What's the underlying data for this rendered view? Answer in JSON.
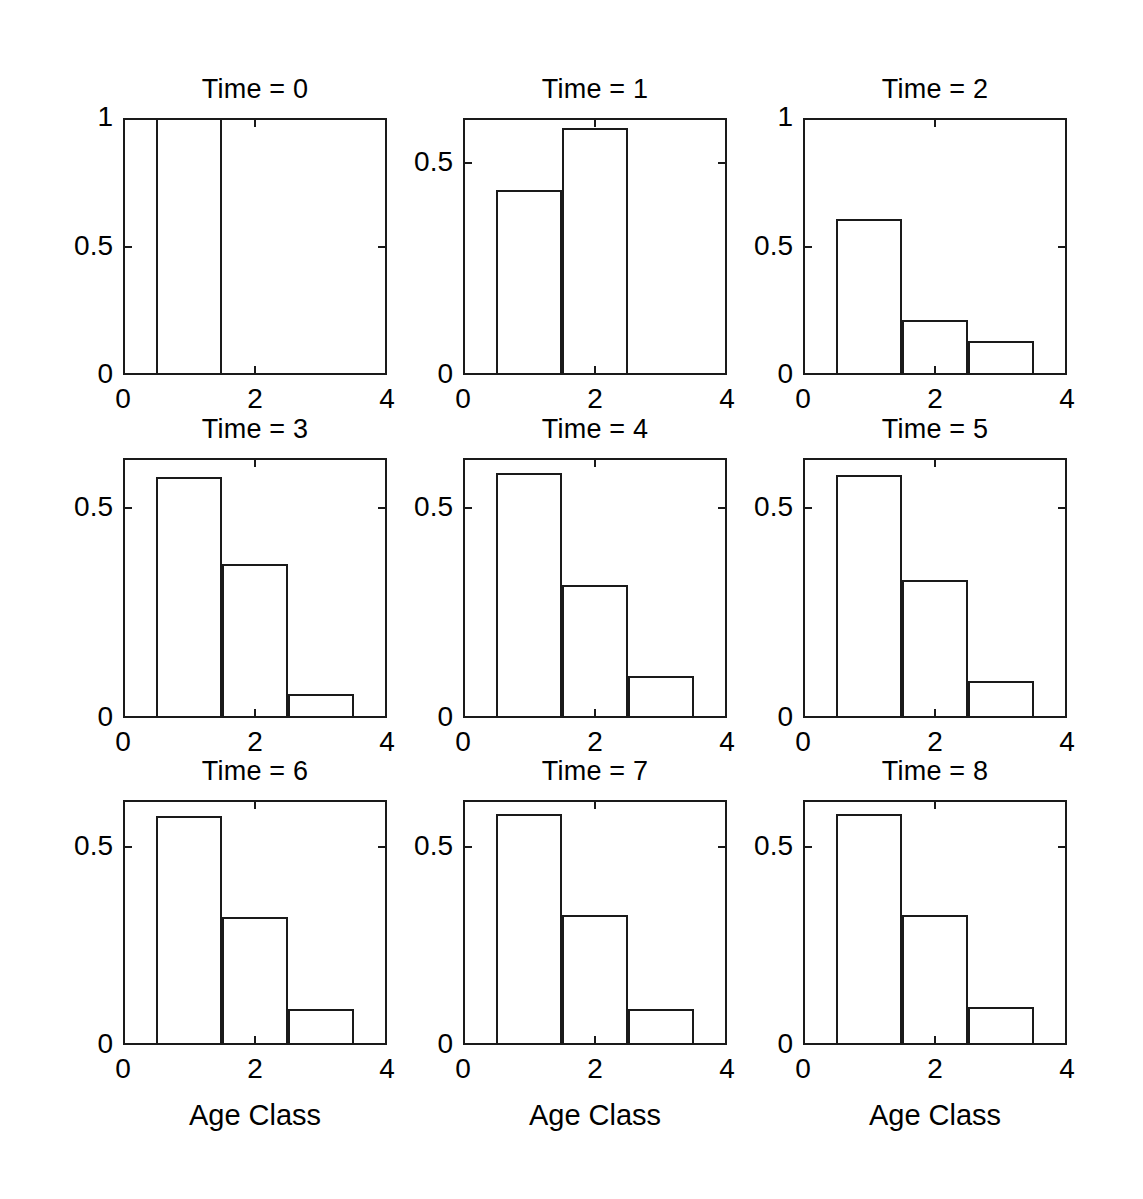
{
  "chart_data": {
    "type": "bar",
    "title": "",
    "subtitle": "",
    "layout": {
      "rows": 3,
      "cols": 3,
      "shared_xlabel": "Age Class",
      "shared_ylabel": "Fraction",
      "grid": false,
      "legend": "none"
    },
    "xlabel": "Age Class",
    "ylabel": "Fraction",
    "xlim": [
      0,
      4
    ],
    "xticks": [
      0,
      2,
      4
    ],
    "xtick_labels": [
      "0",
      "2",
      "4"
    ],
    "categories": [
      1,
      2,
      3
    ],
    "bar_width": 1.0,
    "panels": [
      {
        "id": "time-0",
        "title": "Time = 0",
        "ylim": [
          0,
          1
        ],
        "yticks": [
          0,
          0.5,
          1
        ],
        "ytick_labels": [
          "0",
          "0.5",
          "1"
        ],
        "show_ylabel": true,
        "show_xlabel": false,
        "values": [
          1.0,
          0.0,
          0.0
        ]
      },
      {
        "id": "time-1",
        "title": "Time = 1",
        "ylim": [
          0,
          0.607
        ],
        "yticks": [
          0,
          0.5
        ],
        "ytick_labels": [
          "0",
          "0.5"
        ],
        "show_ylabel": false,
        "show_xlabel": false,
        "values": [
          0.438,
          0.583,
          0.0
        ]
      },
      {
        "id": "time-2",
        "title": "Time = 2",
        "ylim": [
          0,
          1
        ],
        "yticks": [
          0,
          0.5,
          1
        ],
        "ytick_labels": [
          "0",
          "0.5",
          "1"
        ],
        "show_ylabel": false,
        "show_xlabel": false,
        "values": [
          0.607,
          0.214,
          0.132
        ]
      },
      {
        "id": "time-3",
        "title": "Time = 3",
        "ylim": [
          0,
          0.62
        ],
        "yticks": [
          0,
          0.5
        ],
        "ytick_labels": [
          "0",
          "0.5"
        ],
        "show_ylabel": true,
        "show_xlabel": false,
        "values": [
          0.575,
          0.368,
          0.058
        ]
      },
      {
        "id": "time-4",
        "title": "Time = 4",
        "ylim": [
          0,
          0.62
        ],
        "yticks": [
          0,
          0.5
        ],
        "ytick_labels": [
          "0",
          "0.5"
        ],
        "show_ylabel": false,
        "show_xlabel": false,
        "values": [
          0.585,
          0.318,
          0.1
        ]
      },
      {
        "id": "time-5",
        "title": "Time = 5",
        "ylim": [
          0,
          0.62
        ],
        "yticks": [
          0,
          0.5
        ],
        "ytick_labels": [
          "0",
          "0.5"
        ],
        "show_ylabel": false,
        "show_xlabel": false,
        "values": [
          0.58,
          0.33,
          0.088
        ]
      },
      {
        "id": "time-6",
        "title": "Time = 6",
        "ylim": [
          0,
          0.62
        ],
        "yticks": [
          0,
          0.5
        ],
        "ytick_labels": [
          "0",
          "0.5"
        ],
        "show_ylabel": true,
        "show_xlabel": true,
        "values": [
          0.58,
          0.325,
          0.09
        ]
      },
      {
        "id": "time-7",
        "title": "Time = 7",
        "ylim": [
          0,
          0.62
        ],
        "yticks": [
          0,
          0.5
        ],
        "ytick_labels": [
          "0",
          "0.5"
        ],
        "show_ylabel": false,
        "show_xlabel": true,
        "values": [
          0.585,
          0.33,
          0.09
        ]
      },
      {
        "id": "time-8",
        "title": "Time = 8",
        "ylim": [
          0,
          0.62
        ],
        "yticks": [
          0,
          0.5
        ],
        "ytick_labels": [
          "0",
          "0.5"
        ],
        "show_ylabel": false,
        "show_xlabel": true,
        "values": [
          0.585,
          0.33,
          0.095
        ]
      }
    ]
  },
  "style": {
    "line_color": "#1a1a1a",
    "background": "#ffffff",
    "text_color": "#000000"
  }
}
